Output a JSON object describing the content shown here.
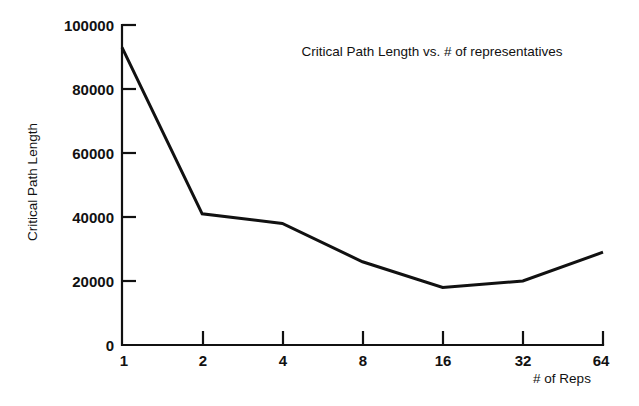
{
  "chart_data": {
    "type": "line",
    "title": "Critical Path Length vs. # of representatives",
    "xlabel": "# of Reps",
    "ylabel": "Critical Path Length",
    "x": [
      1,
      2,
      4,
      8,
      16,
      32,
      64
    ],
    "x_tick_labels": [
      "1",
      "2",
      "4",
      "8",
      "16",
      "32",
      "64"
    ],
    "x_scale": "log2",
    "values": [
      93000,
      41000,
      38000,
      26000,
      18000,
      20000,
      29000
    ],
    "y_ticks": [
      0,
      20000,
      40000,
      60000,
      80000,
      100000
    ],
    "y_tick_labels": [
      "0",
      "20000",
      "40000",
      "60000",
      "80000",
      "100000"
    ],
    "ylim": [
      0,
      100000
    ],
    "grid": false,
    "legend": "none",
    "series": [
      {
        "name": "Critical Path Length",
        "values": [
          93000,
          41000,
          38000,
          26000,
          18000,
          20000,
          29000
        ],
        "color": "#111111"
      }
    ]
  },
  "colors": {
    "background": "#ffffff",
    "foreground": "#111111",
    "line": "#111111"
  }
}
